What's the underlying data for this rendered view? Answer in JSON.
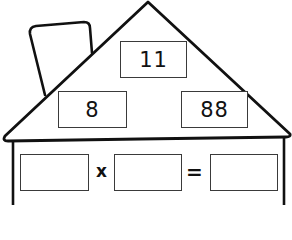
{
  "worksheet": {
    "type": "fact-family-house",
    "roof": {
      "top_value": "11",
      "left_value": "8",
      "right_value": "88"
    },
    "equation": {
      "operand1": "",
      "operator": "x",
      "operand2": "",
      "equals": "=",
      "result": ""
    }
  }
}
